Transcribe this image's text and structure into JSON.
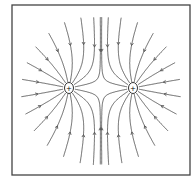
{
  "diagram": {
    "charges": [
      {
        "label": "+",
        "x": 69,
        "y": 88
      },
      {
        "label": "+",
        "x": 133,
        "y": 88
      }
    ],
    "line_color": "#555555",
    "frame": {
      "x": 12,
      "y": 5,
      "w": 178,
      "h": 170
    }
  }
}
